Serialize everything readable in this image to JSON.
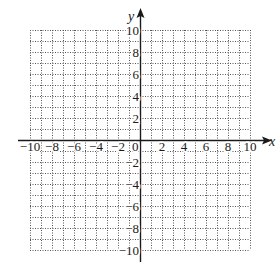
{
  "figure": {
    "type": "coordinate-grid",
    "x_axis": {
      "label": "x",
      "min": -10,
      "max": 10,
      "grid_step": 1,
      "tick_labels": [
        "-10",
        "-8",
        "-6",
        "-4",
        "-2",
        "0",
        "2",
        "4",
        "6",
        "8",
        "10"
      ],
      "tick_values": [
        -10,
        -8,
        -6,
        -4,
        -2,
        0,
        2,
        4,
        6,
        8,
        10
      ]
    },
    "y_axis": {
      "label": "y",
      "min": -10,
      "max": 10,
      "grid_step": 1,
      "tick_labels": [
        "10",
        "8",
        "6",
        "4",
        "2",
        "-2",
        "-4",
        "-6",
        "-8",
        "-10"
      ],
      "tick_values": [
        10,
        8,
        6,
        4,
        2,
        -2,
        -4,
        -6,
        -8,
        -10
      ]
    },
    "grid_style": "dotted",
    "colors": {
      "grid": "#555555",
      "axis": "#1a1a1a",
      "text": "#1a1a1a",
      "background": "#ffffff"
    }
  }
}
